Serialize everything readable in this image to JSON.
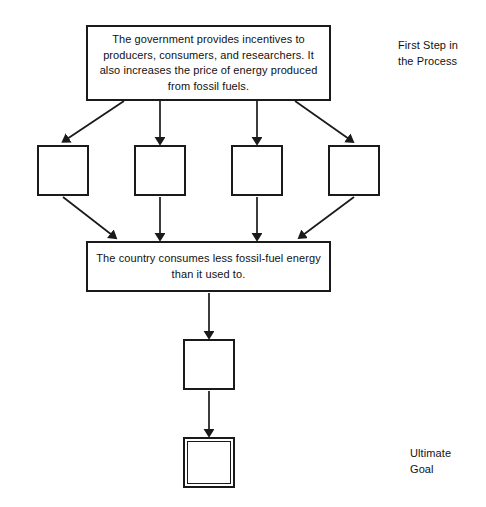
{
  "diagram": {
    "title_text": "",
    "background_color": "#ffffff",
    "stroke_color": "#1a1a1a",
    "text_color": "#111111",
    "nodes": {
      "top_statement": {
        "text": "The government provides incentives to producers, consumers, and researchers. It also increases the price of energy produced from fossil fuels.",
        "x": 86,
        "y": 25,
        "w": 245,
        "h": 76
      },
      "blank_1": {
        "text": "",
        "x": 37,
        "y": 145,
        "w": 52,
        "h": 51
      },
      "blank_2": {
        "text": "",
        "x": 134,
        "y": 145,
        "w": 52,
        "h": 51
      },
      "blank_3": {
        "text": "",
        "x": 231,
        "y": 145,
        "w": 52,
        "h": 51
      },
      "blank_4": {
        "text": "",
        "x": 328,
        "y": 145,
        "w": 52,
        "h": 51
      },
      "middle_statement": {
        "text": "The country consumes less fossil-fuel energy than it used to.",
        "x": 86,
        "y": 241,
        "w": 245,
        "h": 51
      },
      "blank_5": {
        "text": "",
        "x": 183,
        "y": 339,
        "w": 52,
        "h": 51
      },
      "blank_goal": {
        "text": "",
        "x": 183,
        "y": 437,
        "w": 52,
        "h": 51
      }
    },
    "labels": {
      "first_step": {
        "text": "First Step in\nthe Process",
        "x": 398,
        "y": 38
      },
      "ultimate_goal": {
        "text": "Ultimate\nGoal",
        "x": 410,
        "y": 446
      }
    },
    "connectors": [
      {
        "name": "top-to-blank-1",
        "from": "top_statement",
        "to": "blank_1",
        "style": "diagonal-left"
      },
      {
        "name": "top-to-blank-2",
        "from": "top_statement",
        "to": "blank_2",
        "style": "vertical"
      },
      {
        "name": "top-to-blank-3",
        "from": "top_statement",
        "to": "blank_3",
        "style": "vertical"
      },
      {
        "name": "top-to-blank-4",
        "from": "top_statement",
        "to": "blank_4",
        "style": "diagonal-right"
      },
      {
        "name": "blank-1-to-middle",
        "from": "blank_1",
        "to": "middle_statement",
        "style": "diagonal-right"
      },
      {
        "name": "blank-2-to-middle",
        "from": "blank_2",
        "to": "middle_statement",
        "style": "vertical"
      },
      {
        "name": "blank-3-to-middle",
        "from": "blank_3",
        "to": "middle_statement",
        "style": "vertical"
      },
      {
        "name": "blank-4-to-middle",
        "from": "blank_4",
        "to": "middle_statement",
        "style": "diagonal-left"
      },
      {
        "name": "middle-to-blank-5",
        "from": "middle_statement",
        "to": "blank_5",
        "style": "vertical"
      },
      {
        "name": "blank-5-to-goal",
        "from": "blank_5",
        "to": "blank_goal",
        "style": "vertical"
      }
    ]
  }
}
